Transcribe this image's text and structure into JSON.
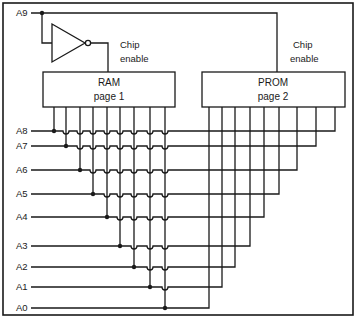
{
  "diagram": {
    "type": "memory paging circuit",
    "colors": {
      "line": "#1a1a1a",
      "background": "#ffffff"
    },
    "select_line": {
      "label": "A9"
    },
    "inverter": {
      "name": "NOT gate"
    },
    "ram": {
      "title": "RAM",
      "subtitle": "page 1",
      "enable_label_1": "Chip",
      "enable_label_2": "enable"
    },
    "prom": {
      "title": "PROM",
      "subtitle": "page 2",
      "enable_label_1": "Chip",
      "enable_label_2": "enable"
    },
    "address_lines": [
      {
        "label": "A8",
        "y": 131
      },
      {
        "label": "A7",
        "y": 146
      },
      {
        "label": "A6",
        "y": 170
      },
      {
        "label": "A5",
        "y": 194
      },
      {
        "label": "A4",
        "y": 217
      },
      {
        "label": "A3",
        "y": 246
      },
      {
        "label": "A2",
        "y": 267
      },
      {
        "label": "A1",
        "y": 287
      },
      {
        "label": "A0",
        "y": 308
      }
    ],
    "ram_pins_x": [
      54,
      66,
      80,
      93,
      107,
      120,
      134,
      150,
      165
    ],
    "prom_pins_x": [
      335,
      316,
      297,
      279,
      264,
      250,
      235,
      222,
      209
    ]
  }
}
